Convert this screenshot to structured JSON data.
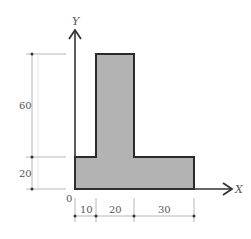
{
  "figure": {
    "type": "L-shaped cross-section with dimensions",
    "colors": {
      "fill": "#b3b3b3",
      "outline": "#2a2a2a",
      "axis": "#333333",
      "dimension_line": "#999999",
      "text": "#555555"
    },
    "axes": {
      "x_label": "X",
      "y_label": "Y",
      "origin_label": "0"
    },
    "dimensions": {
      "vertical": [
        {
          "label": "60"
        },
        {
          "label": "20"
        }
      ],
      "horizontal": [
        {
          "label": "10"
        },
        {
          "label": "20"
        },
        {
          "label": "30"
        }
      ]
    }
  }
}
